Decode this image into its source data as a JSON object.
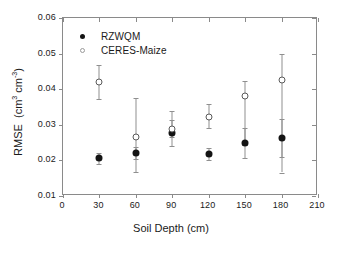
{
  "chart_data": {
    "type": "scatter",
    "title": "",
    "xlabel": "Soil Depth (cm)",
    "ylabel": "RMSE (cm3 cm-3)",
    "ylabel_parts": {
      "prefix": "RMSE  (cm",
      "sup1": "3",
      "mid": " cm",
      "sup2": "-3",
      "suffix": ")"
    },
    "xlim": [
      0,
      210
    ],
    "ylim": [
      0.01,
      0.06
    ],
    "xticks": [
      0,
      30,
      60,
      90,
      120,
      150,
      180,
      210
    ],
    "xtick_labels": [
      "0",
      "30",
      "60",
      "90",
      "120",
      "150",
      "180",
      "210"
    ],
    "yticks": [
      0.01,
      0.02,
      0.03,
      0.04,
      0.05,
      0.06
    ],
    "ytick_labels": [
      "0.01",
      "0.02",
      "0.03",
      "0.04",
      "0.05",
      "0.06"
    ],
    "grid": false,
    "legend_position": "top-left",
    "x": [
      30,
      60,
      90,
      120,
      150,
      180
    ],
    "series": [
      {
        "name": "RZWQM",
        "marker": "filled-circle",
        "color": "#141414",
        "values": [
          0.0206,
          0.022,
          0.0277,
          0.0218,
          0.0249,
          0.0263
        ],
        "err_low": [
          0.019,
          0.0203,
          0.024,
          0.02,
          0.0208,
          0.0209
        ],
        "err_high": [
          0.0222,
          0.0237,
          0.0313,
          0.0236,
          0.029,
          0.0317
        ]
      },
      {
        "name": "CERES-Maize",
        "marker": "open-circle",
        "color": "#5a5a5a",
        "values": [
          0.042,
          0.0267,
          0.0288,
          0.0322,
          0.038,
          0.0427
        ],
        "err_low": [
          0.0373,
          0.0167,
          0.0265,
          0.0292,
          0.0244,
          0.0166
        ],
        "err_high": [
          0.0468,
          0.0374,
          0.0338,
          0.0358,
          0.0422,
          0.05
        ]
      }
    ]
  },
  "legend": {
    "items": [
      {
        "label": "RZWQM",
        "marker": "filled-circle"
      },
      {
        "label": "CERES-Maize",
        "marker": "open-circle"
      }
    ]
  }
}
